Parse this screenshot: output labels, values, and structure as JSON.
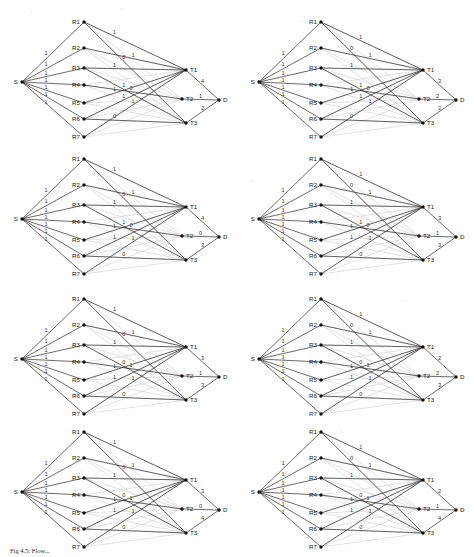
{
  "figure": {
    "caption": "Fig 4.5: Flow...",
    "source_label": "S",
    "sink_label": "D",
    "relay_labels": [
      "R1",
      "R2",
      "R3",
      "R4",
      "R5",
      "R6",
      "R7"
    ],
    "terminal_labels": [
      "T1",
      "T2",
      "T3"
    ],
    "line_color": "#2b2b2b",
    "faint_line_color": "#cfcfcf",
    "node_color": "#111111",
    "background": "#ffffff"
  },
  "chart_data": {
    "type": "diagram",
    "subtype": "layered-flow-network",
    "title": "Fig 4.5: Flow...",
    "layers": [
      "S",
      "R",
      "T",
      "D"
    ],
    "node_labels": {
      "source": "S",
      "relays": [
        "R1",
        "R2",
        "R3",
        "R4",
        "R5",
        "R6",
        "R7"
      ],
      "terminals": [
        "T1",
        "T2",
        "T3"
      ],
      "sink": "D"
    },
    "panel_count": 8,
    "grid": {
      "rows": 4,
      "cols": 2
    },
    "panels": [
      {
        "index": 0,
        "row": 0,
        "col": 0,
        "source_edges": [
          {
            "from": "S",
            "to": "R1",
            "label": "1"
          },
          {
            "from": "S",
            "to": "R2",
            "label": "1"
          },
          {
            "from": "S",
            "to": "R3",
            "label": "1"
          },
          {
            "from": "S",
            "to": "R4",
            "label": "1"
          },
          {
            "from": "S",
            "to": "R5",
            "label": "1"
          },
          {
            "from": "S",
            "to": "R6",
            "label": "1"
          },
          {
            "from": "S",
            "to": "R7",
            "label": "1"
          }
        ],
        "middle_edges": [
          {
            "from": "R1",
            "to": "T1",
            "label": "1"
          },
          {
            "from": "R1",
            "to": "T3",
            "label": "0"
          },
          {
            "from": "R2",
            "to": "T1",
            "label": "1"
          },
          {
            "from": "R3",
            "to": "T1",
            "label": "1"
          },
          {
            "from": "R3",
            "to": "T3",
            "label": "1"
          },
          {
            "from": "R4",
            "to": "T2",
            "label": "0"
          },
          {
            "from": "R5",
            "to": "T1",
            "label": "1"
          },
          {
            "from": "R6",
            "to": "T1",
            "label": "1"
          },
          {
            "from": "R7",
            "to": "T1",
            "label": "1"
          },
          {
            "from": "R6",
            "to": "T3",
            "label": "0"
          }
        ],
        "sink_edges": [
          {
            "from": "T1",
            "to": "D",
            "label": "4"
          },
          {
            "from": "T2",
            "to": "D",
            "label": "1"
          },
          {
            "from": "T3",
            "to": "D",
            "label": "2"
          }
        ]
      },
      {
        "index": 1,
        "row": 0,
        "col": 1,
        "source_edges": [
          {
            "from": "S",
            "to": "R1",
            "label": "1"
          },
          {
            "from": "S",
            "to": "R2",
            "label": "1"
          },
          {
            "from": "S",
            "to": "R3",
            "label": "1"
          },
          {
            "from": "S",
            "to": "R4",
            "label": "1"
          },
          {
            "from": "S",
            "to": "R5",
            "label": "1"
          },
          {
            "from": "S",
            "to": "R6",
            "label": "1"
          },
          {
            "from": "S",
            "to": "R7",
            "label": "1"
          }
        ],
        "middle_edges": [
          {
            "from": "R1",
            "to": "T3",
            "label": "0"
          },
          {
            "from": "R1",
            "to": "T1",
            "label": "1"
          },
          {
            "from": "R2",
            "to": "T1",
            "label": "1"
          },
          {
            "from": "R3",
            "to": "T1",
            "label": "1"
          },
          {
            "from": "R3",
            "to": "T3",
            "label": "1"
          },
          {
            "from": "R4",
            "to": "T2",
            "label": "0"
          },
          {
            "from": "R5",
            "to": "T1",
            "label": "1"
          },
          {
            "from": "R6",
            "to": "T1",
            "label": "1"
          },
          {
            "from": "R7",
            "to": "T1",
            "label": "1"
          },
          {
            "from": "R6",
            "to": "T3",
            "label": "0"
          }
        ],
        "sink_edges": [
          {
            "from": "T1",
            "to": "D",
            "label": "3"
          },
          {
            "from": "T2",
            "to": "D",
            "label": "2"
          },
          {
            "from": "T3",
            "to": "D",
            "label": "2"
          }
        ]
      },
      {
        "index": 2,
        "row": 1,
        "col": 0,
        "source_edges": [
          {
            "from": "S",
            "to": "R1",
            "label": "1"
          },
          {
            "from": "S",
            "to": "R2",
            "label": "1"
          },
          {
            "from": "S",
            "to": "R3",
            "label": "1"
          },
          {
            "from": "S",
            "to": "R4",
            "label": "1"
          },
          {
            "from": "S",
            "to": "R5",
            "label": "1"
          },
          {
            "from": "S",
            "to": "R6",
            "label": "1"
          },
          {
            "from": "S",
            "to": "R7",
            "label": "1"
          }
        ],
        "middle_edges": [
          {
            "from": "R1",
            "to": "T1",
            "label": "1"
          },
          {
            "from": "R1",
            "to": "T3",
            "label": "0"
          },
          {
            "from": "R2",
            "to": "T1",
            "label": "1"
          },
          {
            "from": "R3",
            "to": "T1",
            "label": "1"
          },
          {
            "from": "R3",
            "to": "T3",
            "label": "1"
          },
          {
            "from": "R4",
            "to": "T2",
            "label": "0"
          },
          {
            "from": "R5",
            "to": "T1",
            "label": "1"
          },
          {
            "from": "R6",
            "to": "T3",
            "label": "0"
          },
          {
            "from": "R7",
            "to": "T1",
            "label": "1"
          },
          {
            "from": "R6",
            "to": "T1",
            "label": "1"
          }
        ],
        "sink_edges": [
          {
            "from": "T1",
            "to": "D",
            "label": "4"
          },
          {
            "from": "T2",
            "to": "D",
            "label": "0"
          },
          {
            "from": "T3",
            "to": "D",
            "label": "3"
          }
        ]
      },
      {
        "index": 3,
        "row": 1,
        "col": 1,
        "source_edges": [
          {
            "from": "S",
            "to": "R1",
            "label": "1"
          },
          {
            "from": "S",
            "to": "R2",
            "label": "1"
          },
          {
            "from": "S",
            "to": "R3",
            "label": "1"
          },
          {
            "from": "S",
            "to": "R4",
            "label": "1"
          },
          {
            "from": "S",
            "to": "R5",
            "label": "1"
          },
          {
            "from": "S",
            "to": "R6",
            "label": "1"
          },
          {
            "from": "S",
            "to": "R7",
            "label": "1"
          }
        ],
        "middle_edges": [
          {
            "from": "R1",
            "to": "T3",
            "label": "0"
          },
          {
            "from": "R1",
            "to": "T1",
            "label": "1"
          },
          {
            "from": "R2",
            "to": "T1",
            "label": "1"
          },
          {
            "from": "R3",
            "to": "T1",
            "label": "1"
          },
          {
            "from": "R3",
            "to": "T3",
            "label": "1"
          },
          {
            "from": "R4",
            "to": "T2",
            "label": "0"
          },
          {
            "from": "R5",
            "to": "T1",
            "label": "1"
          },
          {
            "from": "R6",
            "to": "T3",
            "label": "0"
          },
          {
            "from": "R7",
            "to": "T1",
            "label": "1"
          },
          {
            "from": "R6",
            "to": "T1",
            "label": "1"
          }
        ],
        "sink_edges": [
          {
            "from": "T1",
            "to": "D",
            "label": "3"
          },
          {
            "from": "T2",
            "to": "D",
            "label": "1"
          },
          {
            "from": "T3",
            "to": "D",
            "label": "3"
          }
        ]
      },
      {
        "index": 4,
        "row": 2,
        "col": 0,
        "source_edges": [
          {
            "from": "S",
            "to": "R1",
            "label": "1"
          },
          {
            "from": "S",
            "to": "R2",
            "label": "1"
          },
          {
            "from": "S",
            "to": "R3",
            "label": "1"
          },
          {
            "from": "S",
            "to": "R4",
            "label": "1"
          },
          {
            "from": "S",
            "to": "R5",
            "label": "1"
          },
          {
            "from": "S",
            "to": "R6",
            "label": "1"
          },
          {
            "from": "S",
            "to": "R7",
            "label": "1"
          }
        ],
        "middle_edges": [
          {
            "from": "R1",
            "to": "T1",
            "label": "1"
          },
          {
            "from": "R1",
            "to": "T3",
            "label": "0"
          },
          {
            "from": "R2",
            "to": "T1",
            "label": "1"
          },
          {
            "from": "R3",
            "to": "T1",
            "label": "1"
          },
          {
            "from": "R3",
            "to": "T3",
            "label": "0"
          },
          {
            "from": "R4",
            "to": "T2",
            "label": "1"
          },
          {
            "from": "R5",
            "to": "T1",
            "label": "1"
          },
          {
            "from": "R6",
            "to": "T3",
            "label": "0"
          },
          {
            "from": "R7",
            "to": "T1",
            "label": "1"
          },
          {
            "from": "R6",
            "to": "T1",
            "label": "1"
          }
        ],
        "sink_edges": [
          {
            "from": "T1",
            "to": "D",
            "label": "3"
          },
          {
            "from": "T2",
            "to": "D",
            "label": "1"
          },
          {
            "from": "T3",
            "to": "D",
            "label": "3"
          }
        ]
      },
      {
        "index": 5,
        "row": 2,
        "col": 1,
        "source_edges": [
          {
            "from": "S",
            "to": "R1",
            "label": "1"
          },
          {
            "from": "S",
            "to": "R2",
            "label": "1"
          },
          {
            "from": "S",
            "to": "R3",
            "label": "1"
          },
          {
            "from": "S",
            "to": "R4",
            "label": "1"
          },
          {
            "from": "S",
            "to": "R5",
            "label": "1"
          },
          {
            "from": "S",
            "to": "R6",
            "label": "1"
          },
          {
            "from": "S",
            "to": "R7",
            "label": "1"
          }
        ],
        "middle_edges": [
          {
            "from": "R1",
            "to": "T3",
            "label": "0"
          },
          {
            "from": "R1",
            "to": "T1",
            "label": "1"
          },
          {
            "from": "R2",
            "to": "T1",
            "label": "1"
          },
          {
            "from": "R3",
            "to": "T1",
            "label": "1"
          },
          {
            "from": "R3",
            "to": "T3",
            "label": "0"
          },
          {
            "from": "R4",
            "to": "T2",
            "label": "1"
          },
          {
            "from": "R5",
            "to": "T1",
            "label": "1"
          },
          {
            "from": "R6",
            "to": "T3",
            "label": "0"
          },
          {
            "from": "R7",
            "to": "T1",
            "label": "1"
          },
          {
            "from": "R6",
            "to": "T1",
            "label": "1"
          }
        ],
        "sink_edges": [
          {
            "from": "T1",
            "to": "D",
            "label": "2"
          },
          {
            "from": "T2",
            "to": "D",
            "label": "2"
          },
          {
            "from": "T3",
            "to": "D",
            "label": "3"
          }
        ]
      },
      {
        "index": 6,
        "row": 3,
        "col": 0,
        "source_edges": [
          {
            "from": "S",
            "to": "R1",
            "label": "1"
          },
          {
            "from": "S",
            "to": "R2",
            "label": "1"
          },
          {
            "from": "S",
            "to": "R3",
            "label": "1"
          },
          {
            "from": "S",
            "to": "R4",
            "label": "1"
          },
          {
            "from": "S",
            "to": "R5",
            "label": "1"
          },
          {
            "from": "S",
            "to": "R6",
            "label": "1"
          },
          {
            "from": "S",
            "to": "R7",
            "label": "1"
          }
        ],
        "middle_edges": [
          {
            "from": "R1",
            "to": "T1",
            "label": "1"
          },
          {
            "from": "R1",
            "to": "T3",
            "label": "0"
          },
          {
            "from": "R2",
            "to": "T1",
            "label": "1"
          },
          {
            "from": "R3",
            "to": "T1",
            "label": "1"
          },
          {
            "from": "R3",
            "to": "T3",
            "label": "0"
          },
          {
            "from": "R4",
            "to": "T2",
            "label": "1"
          },
          {
            "from": "R5",
            "to": "T1",
            "label": "1"
          },
          {
            "from": "R6",
            "to": "T3",
            "label": "0"
          },
          {
            "from": "R7",
            "to": "T1",
            "label": "1"
          },
          {
            "from": "R6",
            "to": "T1",
            "label": "1"
          }
        ],
        "sink_edges": [
          {
            "from": "T1",
            "to": "D",
            "label": "3"
          },
          {
            "from": "T2",
            "to": "D",
            "label": "0"
          },
          {
            "from": "T3",
            "to": "D",
            "label": "4"
          }
        ]
      },
      {
        "index": 7,
        "row": 3,
        "col": 1,
        "source_edges": [
          {
            "from": "S",
            "to": "R1",
            "label": "1"
          },
          {
            "from": "S",
            "to": "R2",
            "label": "1"
          },
          {
            "from": "S",
            "to": "R3",
            "label": "1"
          },
          {
            "from": "S",
            "to": "R4",
            "label": "1"
          },
          {
            "from": "S",
            "to": "R5",
            "label": "1"
          },
          {
            "from": "S",
            "to": "R6",
            "label": "1"
          },
          {
            "from": "S",
            "to": "R7",
            "label": "1"
          }
        ],
        "middle_edges": [
          {
            "from": "R1",
            "to": "T3",
            "label": "0"
          },
          {
            "from": "R1",
            "to": "T1",
            "label": "1"
          },
          {
            "from": "R2",
            "to": "T1",
            "label": "1"
          },
          {
            "from": "R3",
            "to": "T1",
            "label": "1"
          },
          {
            "from": "R3",
            "to": "T3",
            "label": "0"
          },
          {
            "from": "R4",
            "to": "T2",
            "label": "1"
          },
          {
            "from": "R5",
            "to": "T1",
            "label": "1"
          },
          {
            "from": "R6",
            "to": "T3",
            "label": "0"
          },
          {
            "from": "R7",
            "to": "T1",
            "label": "1"
          },
          {
            "from": "R6",
            "to": "T1",
            "label": "1"
          }
        ],
        "sink_edges": [
          {
            "from": "T1",
            "to": "D",
            "label": "2"
          },
          {
            "from": "T2",
            "to": "D",
            "label": "1"
          },
          {
            "from": "T3",
            "to": "D",
            "label": "4"
          }
        ]
      }
    ]
  }
}
